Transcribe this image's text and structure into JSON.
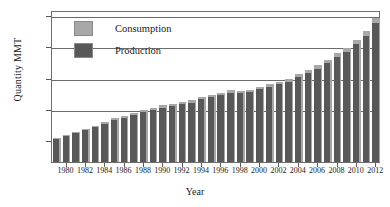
{
  "chart_data": {
    "type": "bar",
    "title": "",
    "xlabel": "Year",
    "ylabel": "Quantity MMT",
    "grid": true,
    "legend_position": "top-left",
    "ylim": [
      31,
      516
    ],
    "yticks": [
      100,
      200,
      300,
      400,
      500
    ],
    "gridlines": [
      200,
      300,
      400,
      500
    ],
    "xtick_labels": [
      "1980",
      "1982",
      "1984",
      "1986",
      "1988",
      "1990",
      "1992",
      "1994",
      "1996",
      "1998",
      "2000",
      "2002",
      "2004",
      "2006",
      "2008",
      "2010",
      "2012"
    ],
    "categories": [
      1979,
      1980,
      1981,
      1982,
      1983,
      1984,
      1985,
      1986,
      1987,
      1988,
      1989,
      1990,
      1991,
      1992,
      1993,
      1994,
      1995,
      1996,
      1997,
      1998,
      1999,
      2000,
      2001,
      2002,
      2003,
      2004,
      2005,
      2006,
      2007,
      2008,
      2009,
      2010,
      2011,
      2012
    ],
    "series": [
      {
        "name": "Consumption",
        "color": "#a8a8a8",
        "values": [
          108,
          118,
          128,
          138,
          147,
          160,
          170,
          178,
          186,
          197,
          203,
          212,
          217,
          222,
          228,
          240,
          245,
          252,
          260,
          258,
          262,
          272,
          281,
          288,
          297,
          312,
          325,
          340,
          358,
          378,
          395,
          420,
          448,
          492
        ]
      },
      {
        "name": "Production",
        "color": "#585858",
        "values": [
          104,
          114,
          123,
          133,
          142,
          154,
          164,
          172,
          180,
          190,
          196,
          205,
          210,
          215,
          221,
          232,
          238,
          244,
          252,
          250,
          254,
          263,
          272,
          279,
          288,
          302,
          315,
          329,
          347,
          366,
          383,
          407,
          434,
          476
        ]
      }
    ]
  },
  "legend": {
    "items": [
      {
        "label": "Consumption",
        "color": "#a8a8a8"
      },
      {
        "label": "Production",
        "color": "#585858"
      }
    ]
  },
  "axes": {
    "x_title": "Year",
    "y_title": "Quantity MMT"
  }
}
